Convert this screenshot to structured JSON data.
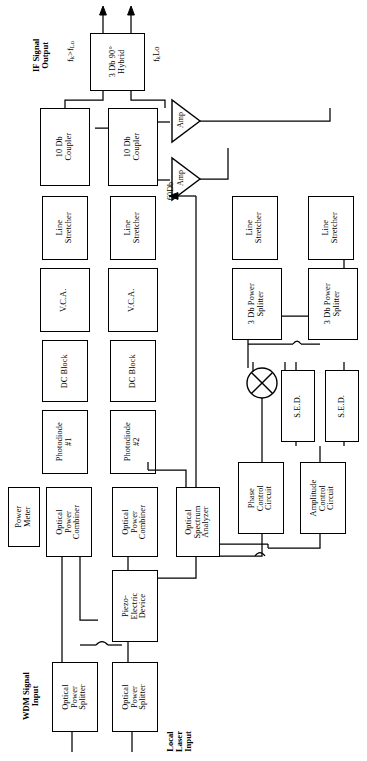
{
  "diagram": {
    "orientation": "rotated-90-ccw",
    "line_color": "#000000",
    "background_color": "#ffffff"
  },
  "annotations": {
    "if_signal_output": "IF Signal\nOutput",
    "freq_upper": "fₖ>fₗₒ",
    "freq_lower": "fₖ<fₗₒ",
    "wdm_signal_input": "WDM Signal\nInput",
    "local_laser_input": "Local\nLaser\nInput",
    "amp_gain": "60Db"
  },
  "blocks": [
    {
      "id": "hybrid",
      "label": "3 Db 90°\nHybrid",
      "x": 90,
      "y": 33,
      "w": 55,
      "h": 58
    },
    {
      "id": "coupler1",
      "label": "10 Db\nCoupler",
      "x": 86,
      "y": 108,
      "w": 60,
      "h": 40
    },
    {
      "id": "coupler2",
      "label": "10 Db\nCoupler",
      "x": 86,
      "y": 160,
      "w": 60,
      "h": 40
    },
    {
      "id": "stretch1",
      "label": "Line\nStretcher",
      "x": 200,
      "y": 108,
      "w": 56,
      "h": 40
    },
    {
      "id": "stretch2",
      "label": "Line\nStretcher",
      "x": 200,
      "y": 160,
      "w": 56,
      "h": 40
    },
    {
      "id": "vca1",
      "label": "V.C.A.",
      "x": 268,
      "y": 108,
      "w": 56,
      "h": 40
    },
    {
      "id": "vca2",
      "label": "V.C.A.",
      "x": 268,
      "y": 160,
      "w": 56,
      "h": 40
    },
    {
      "id": "dcblock1",
      "label": "DC Block",
      "x": 340,
      "y": 108,
      "w": 52,
      "h": 40
    },
    {
      "id": "dcblock2",
      "label": "DC Block",
      "x": 340,
      "y": 160,
      "w": 52,
      "h": 40
    },
    {
      "id": "photodiode1",
      "label": "Photodiode\n#1",
      "x": 405,
      "y": 108,
      "w": 56,
      "h": 40
    },
    {
      "id": "photodiode2",
      "label": "Photodiode\n#2",
      "x": 405,
      "y": 160,
      "w": 56,
      "h": 40
    },
    {
      "id": "powermeter",
      "label": "Power\nMeter",
      "x": 487,
      "y": 108,
      "w": 60,
      "h": 36
    },
    {
      "id": "combiner1",
      "label": "Optical\nPower\nCombiner",
      "x": 487,
      "y": 158,
      "w": 62,
      "h": 48
    },
    {
      "id": "combiner2",
      "label": "Optical\nPower\nCombiner",
      "x": 487,
      "y": 220,
      "w": 62,
      "h": 48
    },
    {
      "id": "osa",
      "label": "Optical\nSpectrum\nAnalyzer",
      "x": 487,
      "y": 286,
      "w": 62,
      "h": 50
    },
    {
      "id": "piezo",
      "label": "Piezo-\nElectric\nDevice",
      "x": 578,
      "y": 215,
      "w": 72,
      "h": 52
    },
    {
      "id": "splitter1",
      "label": "Optical\nPower\nSplitter",
      "x": 682,
      "y": 158,
      "w": 68,
      "h": 48
    },
    {
      "id": "splitter2",
      "label": "Optical\nPower\nSplitter",
      "x": 682,
      "y": 220,
      "w": 68,
      "h": 48
    },
    {
      "id": "stretch3",
      "label": "Line\nStretcher",
      "x": 200,
      "y": 262,
      "w": 56,
      "h": 40
    },
    {
      "id": "stretch4",
      "label": "Line\nStretcher",
      "x": 200,
      "y": 322,
      "w": 56,
      "h": 40
    },
    {
      "id": "psplit1",
      "label": "3 Db Power\nSplitter",
      "x": 268,
      "y": 262,
      "w": 60,
      "h": 40
    },
    {
      "id": "psplit2",
      "label": "3 Db Power\nSplitter",
      "x": 268,
      "y": 322,
      "w": 60,
      "h": 40
    },
    {
      "id": "sed1",
      "label": "S.E.D.",
      "x": 378,
      "y": 278,
      "w": 60,
      "h": 36
    },
    {
      "id": "sed2",
      "label": "S.E.D.",
      "x": 378,
      "y": 326,
      "w": 60,
      "h": 36
    },
    {
      "id": "phasectl",
      "label": "Phase\nControl\nCircuit",
      "x": 478,
      "y": 262,
      "w": 62,
      "h": 52
    },
    {
      "id": "amplctl",
      "label": "Amplitude\nControl\nCircuit",
      "x": 478,
      "y": 326,
      "w": 62,
      "h": 52
    }
  ],
  "amplifiers": [
    {
      "id": "amp1",
      "label": "Amp",
      "gain": "60Db"
    },
    {
      "id": "amp2",
      "label": "Amp",
      "gain": "60Db"
    }
  ],
  "mixer": {
    "id": "mixer",
    "symbol": "circle-with-x"
  }
}
